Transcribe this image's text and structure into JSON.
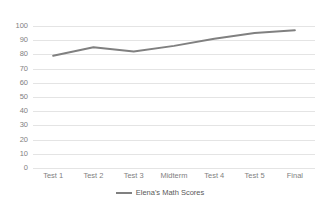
{
  "chart_data": {
    "type": "line",
    "title": "",
    "xlabel": "",
    "ylabel": "",
    "categories": [
      "Test 1",
      "Test 2",
      "Test 3",
      "Midterm",
      "Test 4",
      "Test 5",
      "Final"
    ],
    "series": [
      {
        "name": "Elena's Math Scores",
        "values": [
          79,
          85,
          82,
          86,
          91,
          95,
          97
        ],
        "color": "#808080"
      }
    ],
    "ylim": [
      0,
      100
    ],
    "ytick_step": 10,
    "yticks": [
      0,
      10,
      20,
      30,
      40,
      50,
      60,
      70,
      80,
      90,
      100
    ],
    "grid": true,
    "grid_color": "#e4e4e4",
    "legend_position": "bottom"
  },
  "legend": {
    "entry_label": "Elena's Math Scores"
  }
}
